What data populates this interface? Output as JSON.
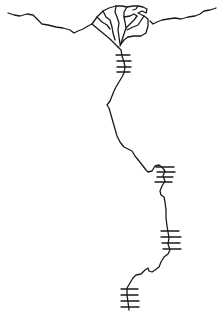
{
  "map": {
    "subject": "river-system-line-drawing",
    "stroke_color": "#1a1a1a",
    "background": "#ffffff",
    "features": {
      "coastline": "coast",
      "delta": "delta-branches",
      "river": "main-channel",
      "crossing_marks": [
        "ticks-1",
        "ticks-2",
        "ticks-3",
        "ticks-4"
      ]
    }
  }
}
